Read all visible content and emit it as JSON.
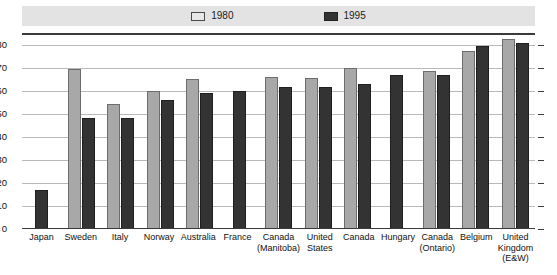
{
  "legend": {
    "entries": [
      {
        "label": "1980",
        "swatch": "light-gray-swatch",
        "color": "#a8a8a8"
      },
      {
        "label": "1995",
        "swatch": "dark-swatch",
        "color": "#333333"
      }
    ]
  },
  "axis": {
    "y_ticks_left": [
      "80",
      "70",
      "60",
      "50",
      "40",
      "30",
      "20",
      "10",
      "0"
    ],
    "y_ticks_right": [
      "80",
      "70",
      "60",
      "50",
      "40",
      "30",
      "20",
      "10",
      "0"
    ]
  },
  "chart_data": {
    "type": "bar",
    "title": "",
    "xlabel": "",
    "ylabel": "",
    "ylim": [
      0,
      85
    ],
    "grid": true,
    "legend_position": "top",
    "categories": [
      "Japan",
      "Sweden",
      "Italy",
      "Norway",
      "Australia",
      "France",
      "Canada\n(Manitoba)",
      "United\nStates",
      "Canada",
      "Hungary",
      "Canada\n(Ontario)",
      "Belgium",
      "United\nKingdom\n(E&W)"
    ],
    "series": [
      {
        "name": "1980",
        "color": "#a8a8a8",
        "values": [
          null,
          69.5,
          54,
          60,
          65,
          null,
          66,
          65.5,
          70,
          null,
          68.5,
          77,
          82.5
        ]
      },
      {
        "name": "1995",
        "color": "#333333",
        "values": [
          17,
          48,
          48,
          56,
          59,
          60,
          61.5,
          61.5,
          63,
          67,
          67,
          79.5,
          80.5
        ]
      }
    ]
  }
}
